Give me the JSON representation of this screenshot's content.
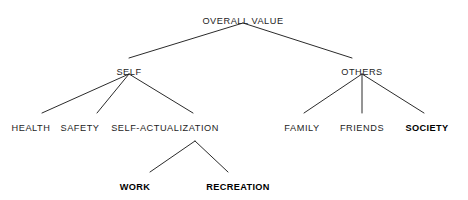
{
  "diagram": {
    "type": "hierarchy-tree",
    "title_text": "OVERALL VALUE",
    "background_color": "#ffffff",
    "line_color": "#2b2b2b",
    "text_color": "#1d1d1d",
    "nodes": [
      {
        "id": "overall-value",
        "label": "OVERALL VALUE",
        "level": 0,
        "x": 243,
        "y": 16,
        "bold": false
      },
      {
        "id": "self",
        "label": "SELF",
        "level": 1,
        "x": 129,
        "y": 67,
        "bold": false
      },
      {
        "id": "others",
        "label": "OTHERS",
        "level": 1,
        "x": 362,
        "y": 67,
        "bold": false
      },
      {
        "id": "health",
        "label": "HEALTH",
        "level": 2,
        "x": 31,
        "y": 123,
        "bold": false
      },
      {
        "id": "safety",
        "label": "SAFETY",
        "level": 2,
        "x": 80,
        "y": 123,
        "bold": false
      },
      {
        "id": "self-actualization",
        "label": "SELF-ACTUALIZATION",
        "level": 2,
        "x": 165,
        "y": 123,
        "bold": false
      },
      {
        "id": "family",
        "label": "FAMILY",
        "level": 2,
        "x": 302,
        "y": 123,
        "bold": false
      },
      {
        "id": "friends",
        "label": "FRIENDS",
        "level": 2,
        "x": 362,
        "y": 123,
        "bold": false
      },
      {
        "id": "society",
        "label": "SOCIETY",
        "level": 2,
        "x": 427,
        "y": 123,
        "bold": true
      },
      {
        "id": "work",
        "label": "WORK",
        "level": 3,
        "x": 135,
        "y": 182,
        "bold": true
      },
      {
        "id": "recreation",
        "label": "RECREATION",
        "level": 3,
        "x": 238,
        "y": 182,
        "bold": true
      }
    ],
    "edges": [
      {
        "id": "edge-overall-self",
        "from": "overall-value",
        "to": "self",
        "x1": 243,
        "y1": 23,
        "x2": 129,
        "y2": 58
      },
      {
        "id": "edge-overall-others",
        "from": "overall-value",
        "to": "others",
        "x1": 243,
        "y1": 23,
        "x2": 352,
        "y2": 58
      },
      {
        "id": "edge-self-health",
        "from": "self",
        "to": "health",
        "x1": 129,
        "y1": 74,
        "x2": 42,
        "y2": 113
      },
      {
        "id": "edge-self-safety",
        "from": "self",
        "to": "safety",
        "x1": 129,
        "y1": 74,
        "x2": 97,
        "y2": 113
      },
      {
        "id": "edge-self-actualization",
        "from": "self",
        "to": "self-actualization",
        "x1": 129,
        "y1": 74,
        "x2": 193,
        "y2": 113
      },
      {
        "id": "edge-others-family",
        "from": "others",
        "to": "family",
        "x1": 362,
        "y1": 74,
        "x2": 304,
        "y2": 113
      },
      {
        "id": "edge-others-friends",
        "from": "others",
        "to": "friends",
        "x1": 362,
        "y1": 74,
        "x2": 362,
        "y2": 113
      },
      {
        "id": "edge-others-society",
        "from": "others",
        "to": "society",
        "x1": 362,
        "y1": 74,
        "x2": 424,
        "y2": 113
      },
      {
        "id": "edge-actualization-work",
        "from": "self-actualization",
        "to": "work",
        "x1": 195,
        "y1": 141,
        "x2": 150,
        "y2": 172
      },
      {
        "id": "edge-actualization-rec",
        "from": "self-actualization",
        "to": "recreation",
        "x1": 195,
        "y1": 141,
        "x2": 228,
        "y2": 172
      }
    ]
  }
}
